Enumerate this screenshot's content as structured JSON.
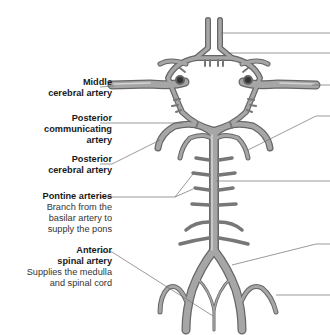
{
  "diagram": {
    "colors": {
      "vessel": "#8f8f8f",
      "vessel_dark": "#5e5e5e",
      "vessel_light": "#c8c8c8",
      "leader_line": "#6e6e6e",
      "text": "#1a1a1a",
      "background": "#ffffff"
    },
    "labels_left": [
      {
        "title": "Middle cerebral artery",
        "title_lines": [
          "Middle",
          "cerebral artery"
        ],
        "desc_lines": []
      },
      {
        "title": "Posterior communicating artery",
        "title_lines": [
          "Posterior",
          "communicating",
          "artery"
        ],
        "desc_lines": []
      },
      {
        "title": "Posterior cerebral artery",
        "title_lines": [
          "Posterior",
          "cerebral artery"
        ],
        "desc_lines": []
      },
      {
        "title": "Pontine arteries",
        "title_lines": [
          "Pontine arteries"
        ],
        "desc_lines": [
          "Branch from the",
          "basilar artery to",
          "supply the pons"
        ]
      },
      {
        "title": "Anterior spinal artery",
        "title_lines": [
          "Anterior",
          "spinal artery"
        ],
        "desc_lines": [
          "Supplies the medulla",
          "and spinal cord"
        ]
      }
    ],
    "labels_right_leader_count": 7
  }
}
